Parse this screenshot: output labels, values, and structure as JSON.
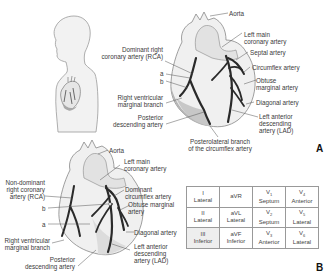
{
  "panel_a": {
    "label": "A",
    "labels": {
      "aorta": "Aorta",
      "left_main_1": "Left main",
      "left_main_2": "coronary artery",
      "dominant_rca_1": "Dominant right",
      "dominant_rca_2": "coronary artery (RCA)",
      "septal": "Septal artery",
      "circumflex": "Circumflex artery",
      "a": "a",
      "b": "b",
      "obtuse_1": "Obtuse",
      "obtuse_2": "marginal artery",
      "rv_marginal_1": "Right ventricular",
      "rv_marginal_2": "marginal branch",
      "diagonal": "Diagonal artery",
      "pda_1": "Posterior",
      "pda_2": "descending artery",
      "lad_1": "Left anterior",
      "lad_2": "descending",
      "lad_3": "artery (LAD)",
      "posterolateral_1": "Posterolateral branch",
      "posterolateral_2": "of the circumflex artery"
    }
  },
  "panel_b": {
    "label": "B",
    "labels": {
      "aorta": "Aorta",
      "left_main_1": "Left main",
      "left_main_2": "coronary artery",
      "nondom_rca_1": "Non-dominant",
      "nondom_rca_2": "right coronary",
      "nondom_rca_3": "artery (RCA)",
      "dom_cx_1": "Dominant",
      "dom_cx_2": "circumflex artery",
      "b": "b",
      "a": "a",
      "obtuse_1": "Obtuse marginal",
      "obtuse_2": "artery",
      "diagonal": "Diagonal artery",
      "rv_marginal_1": "Right ventricular",
      "rv_marginal_2": "marginal branch",
      "lad_1": "Left anterior",
      "lad_2": "descending",
      "lad_3": "artery (LAD)",
      "pda_1": "Posterior",
      "pda_2": "descending artery"
    },
    "lead_table": {
      "rows": [
        [
          {
            "lead": "I",
            "region": "Lateral",
            "shaded": false
          },
          {
            "lead": "aVR",
            "region": "",
            "shaded": false
          },
          {
            "lead": "V1",
            "region": "Septum",
            "shaded": false
          },
          {
            "lead": "V4",
            "region": "Anterior",
            "shaded": false
          }
        ],
        [
          {
            "lead": "II",
            "region": "Lateral",
            "shaded": false
          },
          {
            "lead": "aVL",
            "region": "Lateral",
            "shaded": false
          },
          {
            "lead": "V2",
            "region": "Septum",
            "shaded": false
          },
          {
            "lead": "V5",
            "region": "Lateral",
            "shaded": false
          }
        ],
        [
          {
            "lead": "III",
            "region": "Inferior",
            "shaded": true
          },
          {
            "lead": "aVF",
            "region": "Inferior",
            "shaded": false
          },
          {
            "lead": "V3",
            "region": "Anterior",
            "shaded": false
          },
          {
            "lead": "V6",
            "region": "Lateral",
            "shaded": false
          }
        ]
      ]
    }
  },
  "colors": {
    "artery": "#2a2a2a",
    "heart_fill": "#f0f0f0",
    "heart_shade": "#b5b5b5",
    "silhouette_fill": "#f2f2f2",
    "silhouette_stroke": "#9a9a9a",
    "leader_line": "#555555"
  }
}
